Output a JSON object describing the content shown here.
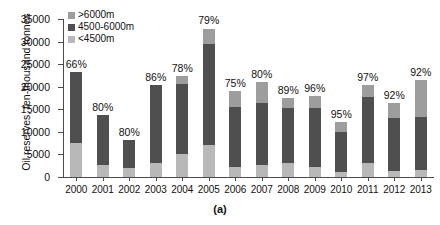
{
  "chart_data": {
    "type": "bar",
    "stacked": true,
    "title": "",
    "caption": "(a)",
    "xlabel": "",
    "ylabel": "Oil reserves, ten-thousand tonnes",
    "ylim": [
      0,
      35000
    ],
    "yticks": [
      0,
      5000,
      10000,
      15000,
      20000,
      25000,
      30000,
      35000
    ],
    "ytick_labels": [
      "0",
      "5000",
      "10000",
      "15000",
      "20000",
      "25000",
      "30000",
      "35000"
    ],
    "grid": false,
    "legend_position": "top-left",
    "categories": [
      "2000",
      "2001",
      "2002",
      "2003",
      "2004",
      "2005",
      "2006",
      "2007",
      "2008",
      "2009",
      "2010",
      "2011",
      "2012",
      "2013"
    ],
    "series": [
      {
        "name": "<4500m",
        "color": "#b8b8b8",
        "values": [
          7600,
          2700,
          1900,
          3200,
          5000,
          7000,
          2200,
          2600,
          3100,
          2300,
          1100,
          3200,
          1400,
          1600
        ]
      },
      {
        "name": "4500-6000m",
        "color": "#4f4f4f",
        "values": [
          15700,
          11100,
          6400,
          17100,
          15700,
          22500,
          13400,
          13900,
          12200,
          13100,
          8900,
          14500,
          11700,
          11800
        ]
      },
      {
        "name": ">6000m",
        "color": "#9d9d9d",
        "values": [
          0,
          0,
          0,
          0,
          1600,
          3400,
          3400,
          4600,
          2300,
          2600,
          2200,
          2700,
          3400,
          8000
        ]
      }
    ],
    "totals": [
      23300,
      13800,
      8300,
      20300,
      22300,
      32900,
      19000,
      21100,
      17600,
      18000,
      12200,
      20400,
      16500,
      21400
    ],
    "data_labels": [
      "66%",
      "80%",
      "80%",
      "86%",
      "78%",
      "79%",
      "75%",
      "80%",
      "89%",
      "96%",
      "95%",
      "97%",
      "92%",
      "92%"
    ],
    "data_label_note": "percentage annotation shown above each bar"
  },
  "legend": {
    "items": [
      {
        "label": ">6000m",
        "color": "#9d9d9d"
      },
      {
        "label": "4500-6000m",
        "color": "#4f4f4f"
      },
      {
        "label": "<4500m",
        "color": "#b8b8b8"
      }
    ]
  }
}
